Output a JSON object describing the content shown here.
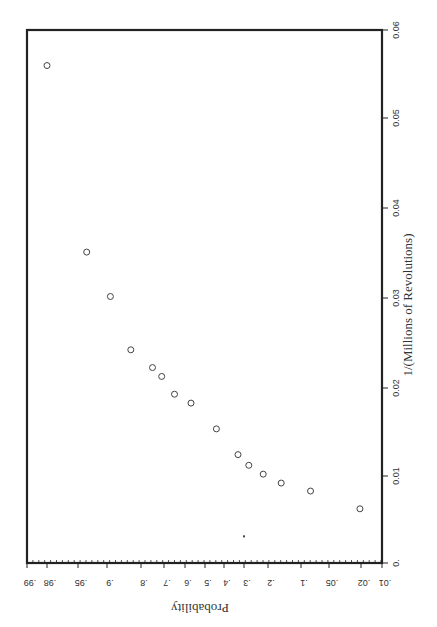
{
  "chart_data": {
    "type": "scatter",
    "title": "",
    "orientation": "rotated 90 degrees clockwise (page rotated)",
    "xlabel": "1/(Millions of Revolutions)",
    "ylabel": "Probability",
    "x_axis": {
      "label": "1/(Millions of Revolutions)",
      "range": [
        0,
        0.06
      ],
      "ticks": [
        "0.",
        "0.01",
        "0.02",
        "0.03",
        "0.04",
        "0.05",
        "0.06"
      ],
      "tick_values": [
        0,
        0.01,
        0.02,
        0.03,
        0.04,
        0.05,
        0.06
      ]
    },
    "y_axis": {
      "label": "Probability",
      "scale": "normal probability",
      "range": [
        0.01,
        0.99
      ],
      "ticks": [
        ".99",
        ".98",
        ".95",
        ".9",
        ".8",
        ".7",
        ".6",
        ".5",
        ".4",
        ".3",
        ".2",
        ".1",
        ".05",
        ".02",
        ".01"
      ],
      "tick_values": [
        0.99,
        0.98,
        0.95,
        0.9,
        0.8,
        0.7,
        0.6,
        0.5,
        0.4,
        0.3,
        0.2,
        0.1,
        0.05,
        0.02,
        0.01
      ]
    },
    "grid": false,
    "legend": null,
    "series": [
      {
        "name": "observations",
        "marker": "open-circle",
        "points": [
          {
            "x": 0.0061,
            "y": 0.021
          },
          {
            "x": 0.0081,
            "y": 0.083
          },
          {
            "x": 0.009,
            "y": 0.16
          },
          {
            "x": 0.01,
            "y": 0.22
          },
          {
            "x": 0.011,
            "y": 0.28
          },
          {
            "x": 0.0122,
            "y": 0.33
          },
          {
            "x": 0.0151,
            "y": 0.44
          },
          {
            "x": 0.018,
            "y": 0.57
          },
          {
            "x": 0.019,
            "y": 0.65
          },
          {
            "x": 0.021,
            "y": 0.71
          },
          {
            "x": 0.022,
            "y": 0.75
          },
          {
            "x": 0.024,
            "y": 0.83
          },
          {
            "x": 0.03,
            "y": 0.89
          },
          {
            "x": 0.035,
            "y": 0.935
          },
          {
            "x": 0.056,
            "y": 0.98
          }
        ]
      },
      {
        "name": "mark",
        "marker": "small-dot",
        "points": [
          {
            "x": 0.003,
            "y": 0.3
          }
        ]
      }
    ]
  },
  "layout": {
    "frame": {
      "left": 27,
      "top": 30,
      "right": 382,
      "bottom": 563
    },
    "prob_tick_px": [
      27,
      47,
      78,
      107,
      141,
      164,
      185,
      205,
      224,
      244,
      268,
      301,
      329,
      361,
      382
    ],
    "x_tick_px": [
      563,
      476,
      388,
      298,
      208,
      118,
      30
    ],
    "colors": {
      "frame": "#222222",
      "marker": "#444444",
      "text": "#333333"
    }
  }
}
